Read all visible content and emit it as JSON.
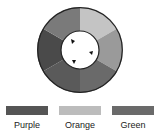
{
  "diagram": {
    "title": "",
    "wheel": {
      "segments": [
        {
          "color": "#c4c4c4"
        },
        {
          "color": "#9a9a9a"
        },
        {
          "color": "#6a6a6a"
        },
        {
          "color": "#5a5a5a"
        },
        {
          "color": "#4a4a4a"
        },
        {
          "color": "#7a7a7a"
        }
      ],
      "arrow_count": 3
    },
    "legend": [
      {
        "label": "Purple",
        "color": "#555555"
      },
      {
        "label": "Orange",
        "color": "#bcbcbc"
      },
      {
        "label": "Green",
        "color": "#6a6a6a"
      }
    ]
  }
}
